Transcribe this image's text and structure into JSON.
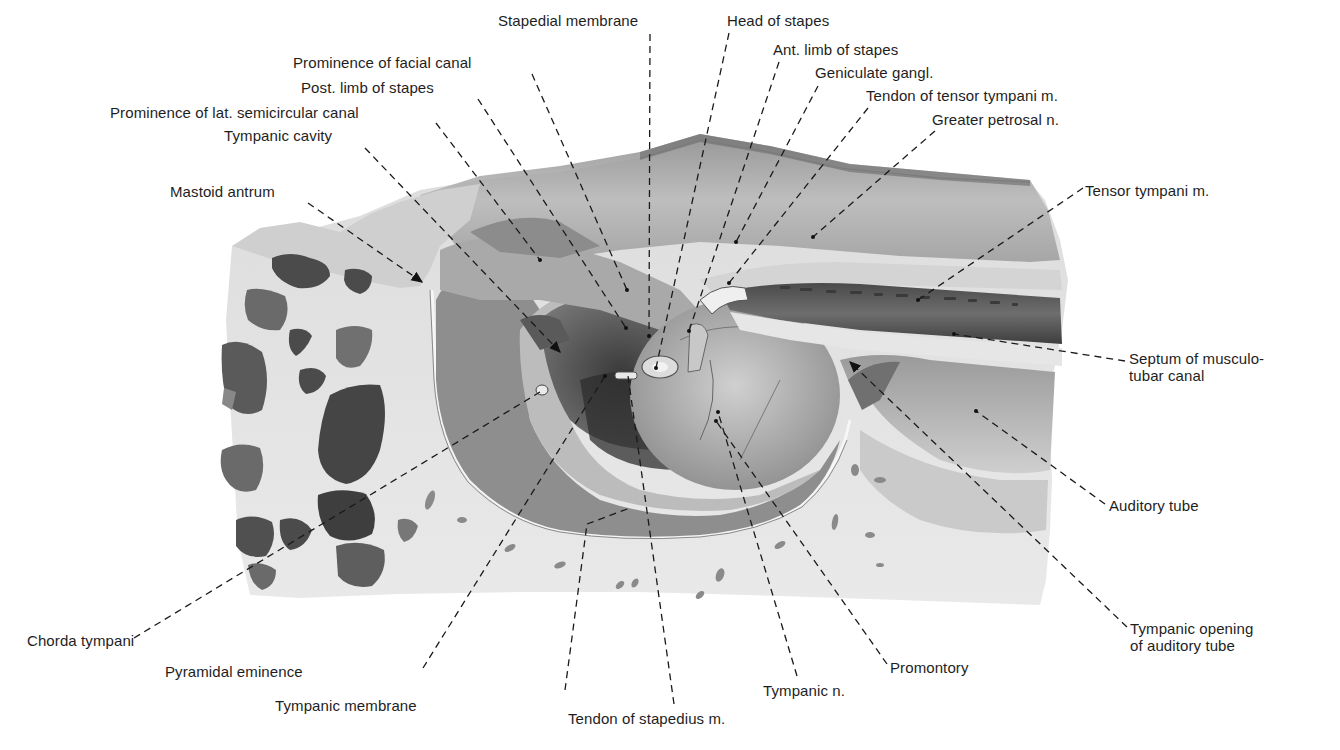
{
  "figure": {
    "palette": {
      "background": "#ffffff",
      "bone_light": "#e4e4e4",
      "bone_mid": "#bdbdbd",
      "tissue_dark": "#5a5a5a",
      "cell_dark": "#3c3c3c",
      "leader_line": "#1a1a1a",
      "label_text": "#1e1e1e"
    }
  },
  "labels": [
    {
      "id": "stapedial-membrane",
      "text": "Stapedial membrane",
      "x": 498,
      "y": 12
    },
    {
      "id": "head-of-stapes",
      "text": "Head of stapes",
      "x": 727,
      "y": 12
    },
    {
      "id": "ant-limb-of-stapes",
      "text": "Ant. limb of stapes",
      "x": 773,
      "y": 41
    },
    {
      "id": "prominence-of-facial-canal",
      "text": "Prominence of facial canal",
      "x": 293,
      "y": 54
    },
    {
      "id": "geniculate-gangl",
      "text": "Geniculate gangl.",
      "x": 815,
      "y": 64
    },
    {
      "id": "post-limb-of-stapes",
      "text": "Post. limb of stapes",
      "x": 301,
      "y": 79
    },
    {
      "id": "tendon-of-tensor-tympani",
      "text": "Tendon of tensor tympani m.",
      "x": 866,
      "y": 87
    },
    {
      "id": "prominence-lat-semicircular-canal",
      "text": "Prominence of lat. semicircular canal",
      "x": 110,
      "y": 104
    },
    {
      "id": "greater-petrosal-n",
      "text": "Greater petrosal n.",
      "x": 932,
      "y": 111
    },
    {
      "id": "tympanic-cavity",
      "text": "Tympanic cavity",
      "x": 224,
      "y": 127
    },
    {
      "id": "mastoid-antrum",
      "text": "Mastoid antrum",
      "x": 170,
      "y": 183
    },
    {
      "id": "tensor-tympani-m",
      "text": "Tensor tympani m.",
      "x": 1085,
      "y": 182
    },
    {
      "id": "septum-musculotubar-canal",
      "text": "Septum of musculo-\ntubar canal",
      "x": 1129,
      "y": 348
    },
    {
      "id": "auditory-tube",
      "text": "Auditory tube",
      "x": 1109,
      "y": 496
    },
    {
      "id": "chorda-tympani",
      "text": "Chorda tympani",
      "x": 27,
      "y": 632
    },
    {
      "id": "tympanic-opening-auditory-tube",
      "text": "Tympanic opening\nof auditory tube",
      "x": 1130,
      "y": 620
    },
    {
      "id": "pyramidal-eminence",
      "text": "Pyramidal eminence",
      "x": 165,
      "y": 663
    },
    {
      "id": "promontory",
      "text": "Promontory",
      "x": 890,
      "y": 659
    },
    {
      "id": "tympanic-n",
      "text": "Tympanic n.",
      "x": 763,
      "y": 682
    },
    {
      "id": "tympanic-membrane",
      "text": "Tympanic membrane",
      "x": 275,
      "y": 697
    },
    {
      "id": "tendon-of-stapedius-m",
      "text": "Tendon of stapedius m.",
      "x": 568,
      "y": 710
    }
  ]
}
